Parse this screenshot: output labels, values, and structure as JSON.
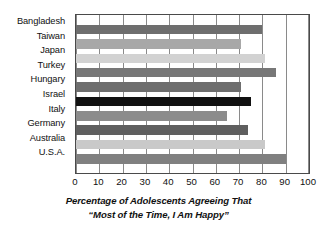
{
  "chart_data": {
    "type": "bar",
    "orientation": "horizontal",
    "title": "",
    "categories": [
      "Bangladesh",
      "Taiwan",
      "Japan",
      "Turkey",
      "Hungary",
      "Israel",
      "Italy",
      "Germany",
      "Australia",
      "U.S.A."
    ],
    "values": [
      80,
      71,
      81,
      86,
      71,
      75,
      65,
      74,
      81,
      90
    ],
    "bar_colors": [
      "#6e6e6e",
      "#a8a8a8",
      "#d2d2d2",
      "#777777",
      "#6e6e6e",
      "#111111",
      "#8c8c8c",
      "#5f5f5f",
      "#c9c9c9",
      "#808080"
    ],
    "xlabel": "",
    "ylabel": "",
    "xlim": [
      0,
      100
    ],
    "xticks": [
      0,
      10,
      20,
      30,
      40,
      50,
      60,
      70,
      80,
      90,
      100
    ],
    "xtick_labels": [
      "0",
      "10",
      "20",
      "30",
      "40",
      "50",
      "60",
      "70",
      "80",
      "90",
      "100"
    ],
    "grid": true,
    "grid_axis": "x",
    "legend": false,
    "caption_line1": "Percentage of Adolescents Agreeing That",
    "caption_line2": "“Most of the Time, I Am Happy”"
  },
  "caption": {
    "line1": "Percentage of Adolescents Agreeing That",
    "line2": "“Most of the Time, I Am Happy”"
  },
  "axis": {
    "x_ticks": [
      "0",
      "10",
      "20",
      "30",
      "40",
      "50",
      "60",
      "70",
      "80",
      "90",
      "100"
    ],
    "y_labels": [
      "Bangladesh",
      "Taiwan",
      "Japan",
      "Turkey",
      "Hungary",
      "Israel",
      "Italy",
      "Germany",
      "Australia",
      "U.S.A."
    ]
  },
  "colors": {
    "axis_line": "#4a4a4a",
    "gridline": "#8a8a8a",
    "text": "#111111",
    "background": "#ffffff"
  }
}
